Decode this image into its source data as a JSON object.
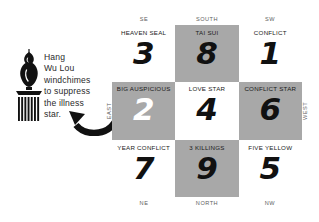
{
  "annotation": {
    "icon_name": "wu-lou-windchime-icon",
    "text": "Hang\nWu Lou\nwindchimes\nto suppress\nthe illness\nstar.",
    "arrow_name": "curved-pointer-arrow-icon"
  },
  "compass": {
    "top": [
      "SE",
      "SOUTH",
      "SW"
    ],
    "bottom": [
      "NE",
      "NORTH",
      "NW"
    ],
    "left": "EAST",
    "right": "WEST"
  },
  "colors": {
    "shaded_cell": "#a8a8a8",
    "plain_cell": "#ffffff",
    "numeral": "#111111",
    "numeral_highlight": "#ffffff",
    "compass_text": "#5e5e5e"
  },
  "grid": {
    "rows": [
      [
        {
          "title": "HEAVEN SEAL",
          "number": "3",
          "shaded": false,
          "white_number": false,
          "direction": "SE"
        },
        {
          "title": "TAI SUI",
          "number": "8",
          "shaded": true,
          "white_number": false,
          "direction": "SOUTH"
        },
        {
          "title": "CONFLICT",
          "number": "1",
          "shaded": false,
          "white_number": false,
          "direction": "SW"
        }
      ],
      [
        {
          "title": "BIG AUSPICIOUS",
          "number": "2",
          "shaded": true,
          "white_number": true,
          "direction": "EAST"
        },
        {
          "title": "LOVE STAR",
          "number": "4",
          "shaded": false,
          "white_number": false,
          "direction": "CENTER"
        },
        {
          "title": "CONFLICT STAR",
          "number": "6",
          "shaded": true,
          "white_number": false,
          "direction": "WEST"
        }
      ],
      [
        {
          "title": "YEAR CONFLICT",
          "number": "7",
          "shaded": false,
          "white_number": false,
          "direction": "NE"
        },
        {
          "title": "3 KILLINGS",
          "number": "9",
          "shaded": true,
          "white_number": false,
          "direction": "NORTH"
        },
        {
          "title": "FIVE YELLOW",
          "number": "5",
          "shaded": false,
          "white_number": false,
          "direction": "NW"
        }
      ]
    ]
  }
}
